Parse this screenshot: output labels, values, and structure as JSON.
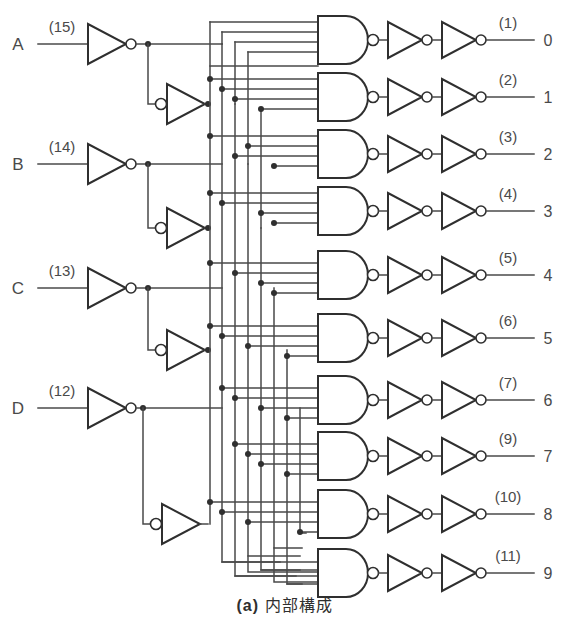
{
  "figure": {
    "caption_label": "(a)",
    "caption_text": "内部構成",
    "kind": "logic-circuit-schematic"
  },
  "colors": {
    "background": "#ffffff",
    "wire": "#4a4a4a",
    "gate": "#2f2f2f",
    "text": "#3a3a3a"
  },
  "inputs": [
    {
      "name": "A",
      "pin": "(15)",
      "y": 44
    },
    {
      "name": "B",
      "pin": "(14)",
      "y": 164
    },
    {
      "name": "C",
      "pin": "(13)",
      "y": 288
    },
    {
      "name": "D",
      "pin": "(12)",
      "y": 408
    }
  ],
  "outputs": [
    {
      "number": "0",
      "pin": "(1)",
      "y": 40
    },
    {
      "number": "1",
      "pin": "(2)",
      "y": 97
    },
    {
      "number": "2",
      "pin": "(3)",
      "y": 154
    },
    {
      "number": "3",
      "pin": "(4)",
      "y": 211
    },
    {
      "number": "4",
      "pin": "(5)",
      "y": 275
    },
    {
      "number": "5",
      "pin": "(6)",
      "y": 338
    },
    {
      "number": "6",
      "pin": "(7)",
      "y": 400
    },
    {
      "number": "7",
      "pin": "(9)",
      "y": 456
    },
    {
      "number": "8",
      "pin": "(10)",
      "y": 514
    },
    {
      "number": "9",
      "pin": "(11)",
      "y": 573
    }
  ],
  "stages": {
    "nand_input_count": 4,
    "inverters_per_output": 2,
    "input_buffer_inverters": 2
  }
}
